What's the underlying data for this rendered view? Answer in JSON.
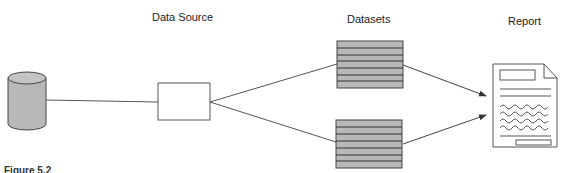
{
  "diagram": {
    "labels": {
      "data_source": "Data Source",
      "datasets": "Datasets",
      "report": "Report"
    },
    "caption": "Figure 5.2",
    "nodes": [
      {
        "id": "database",
        "kind": "cylinder"
      },
      {
        "id": "data-source",
        "kind": "box"
      },
      {
        "id": "dataset-1",
        "kind": "table"
      },
      {
        "id": "dataset-2",
        "kind": "table"
      },
      {
        "id": "report",
        "kind": "document"
      }
    ],
    "edges": [
      {
        "from": "database",
        "to": "data-source",
        "arrow": false
      },
      {
        "from": "data-source",
        "to": "dataset-1",
        "arrow": false
      },
      {
        "from": "data-source",
        "to": "dataset-2",
        "arrow": false
      },
      {
        "from": "dataset-1",
        "to": "report",
        "arrow": true
      },
      {
        "from": "dataset-2",
        "to": "report",
        "arrow": true
      }
    ],
    "colors": {
      "fill_gray": "#b8b8b8",
      "stroke": "#333333"
    }
  }
}
